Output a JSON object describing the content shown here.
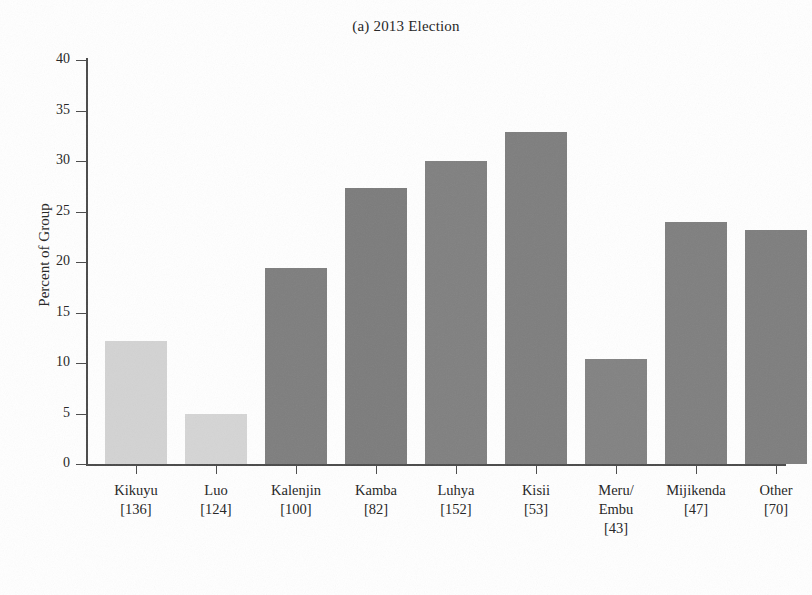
{
  "chart_data": {
    "type": "bar",
    "title": "(a) 2013 Election",
    "xlabel": "",
    "ylabel": "Percent of Group",
    "ylim": [
      0,
      40
    ],
    "ytick_labels": [
      "0",
      "5",
      "10",
      "15",
      "20",
      "25",
      "30",
      "35",
      "40"
    ],
    "ytick_values": [
      0,
      5,
      10,
      15,
      20,
      25,
      30,
      35,
      40
    ],
    "grid": false,
    "legend": "none",
    "categories": [
      "Kikuyu",
      "Luo",
      "Kalenjin",
      "Kamba",
      "Luhya",
      "Kisii",
      "Meru/\nEmbu",
      "Mijikenda",
      "Other"
    ],
    "category_counts": [
      "[136]",
      "[124]",
      "[100]",
      "[82]",
      "[152]",
      "[53]",
      "[43]",
      "[47]",
      "[70]"
    ],
    "values": [
      12.2,
      5.0,
      19.4,
      27.3,
      30.0,
      32.9,
      10.4,
      24.0,
      23.2
    ],
    "bar_colors": [
      "#d3d3d3",
      "#d5d5d5",
      "#7e7e7e",
      "#7c7c7c",
      "#808080",
      "#7e7e7e",
      "#828282",
      "#7f7f7f",
      "#7e7e7e"
    ],
    "bars": [
      {
        "label": "Kikuyu",
        "count": "[136]",
        "value": 12.2,
        "color": "#d3d3d3"
      },
      {
        "label": "Luo",
        "count": "[124]",
        "value": 5.0,
        "color": "#d5d5d5"
      },
      {
        "label": "Kalenjin",
        "count": "[100]",
        "value": 19.4,
        "color": "#7e7e7e"
      },
      {
        "label": "Kamba",
        "count": "[82]",
        "value": 27.3,
        "color": "#7c7c7c"
      },
      {
        "label": "Luhya",
        "count": "[152]",
        "value": 30.0,
        "color": "#808080"
      },
      {
        "label": "Kisii",
        "count": "[53]",
        "value": 32.9,
        "color": "#7e7e7e"
      },
      {
        "label": "Meru/",
        "label2": "Embu",
        "count": "[43]",
        "value": 10.4,
        "color": "#828282"
      },
      {
        "label": "Mijikenda",
        "count": "[47]",
        "value": 24.0,
        "color": "#7f7f7f"
      },
      {
        "label": "Other",
        "count": "[70]",
        "value": 23.2,
        "color": "#7e7e7e"
      }
    ],
    "axis_color": "#4a4a4a",
    "text_color": "#232323",
    "background": "#ffffff"
  }
}
